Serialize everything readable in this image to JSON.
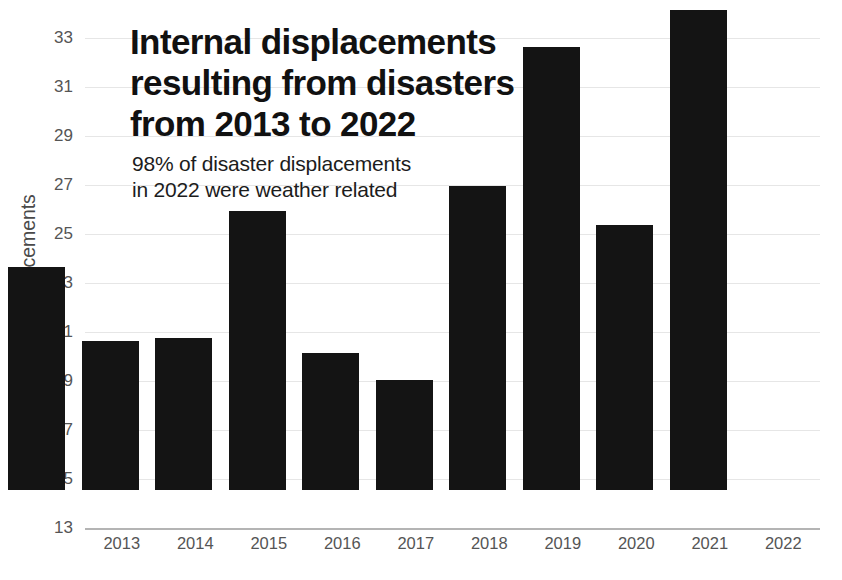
{
  "chart_data": {
    "type": "bar",
    "title_lines": [
      "Internal displacements",
      "resulting from disasters",
      "from 2013 to 2022"
    ],
    "subtitle": "98% of disaster displacements in 2022 were weather related",
    "subtitle_lines": [
      "98% of disaster displacements",
      "in 2022 were weather related"
    ],
    "xlabel": "",
    "ylabel": "Millions of displacements",
    "categories": [
      "2013",
      "2014",
      "2015",
      "2016",
      "2017",
      "2018",
      "2019",
      "2020",
      "2021",
      "2022"
    ],
    "values": [
      22.1,
      19.1,
      19.2,
      24.4,
      18.6,
      17.5,
      25.4,
      31.1,
      23.8,
      32.6
    ],
    "ylim": [
      13,
      33
    ],
    "ytick_step": 2,
    "yticks": [
      13,
      15,
      17,
      19,
      21,
      23,
      25,
      27,
      29,
      31,
      33
    ],
    "ytick_labels": [
      "13",
      "15",
      "17",
      "19",
      "21",
      "23",
      "25",
      "27",
      "29",
      "31",
      "33"
    ],
    "grid": true,
    "legend": null,
    "bar_color": "#141414",
    "grid_color": "#e6e6e6",
    "axis_color": "#b4b4b4",
    "background_color": "#ffffff",
    "tick_text_color": "#555555"
  }
}
